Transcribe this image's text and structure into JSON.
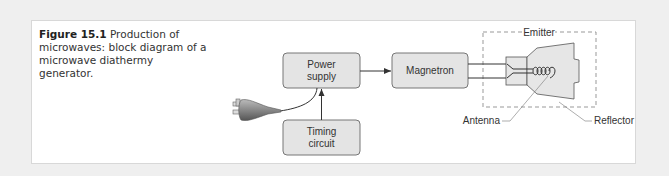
{
  "caption": {
    "figure_label": "Figure 15.1",
    "text": "Production of microwaves: block diagram of a microwave diathermy generator."
  },
  "diagram": {
    "blocks": [
      {
        "id": "power-supply",
        "line1": "Power",
        "line2": "supply"
      },
      {
        "id": "magnetron",
        "line1": "Magnetron"
      },
      {
        "id": "timing-circuit",
        "line1": "Timing",
        "line2": "circuit"
      }
    ],
    "emitter_label": "Emitter",
    "antenna_label": "Antenna",
    "reflector_label": "Reflector",
    "colors": {
      "block_fill": "#e4e4e4",
      "block_stroke": "#777777",
      "line": "#333333",
      "reflector_fill": "#e6e6e6",
      "dash": "#999999"
    }
  }
}
